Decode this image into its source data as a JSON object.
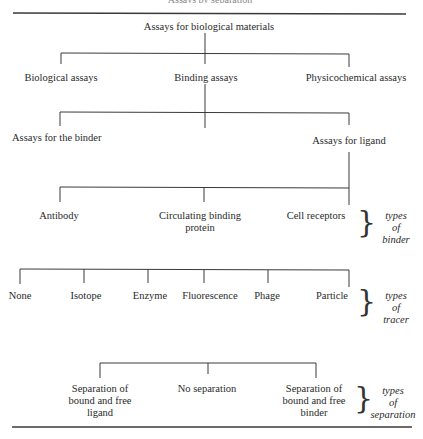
{
  "header": {
    "cut_caption": "Assays by separation"
  },
  "tree": {
    "root": "Assays for biological materials",
    "level1": [
      "Biological assays",
      "Binding assays",
      "Physicochemical assays"
    ],
    "level2": [
      "Assays for the binder",
      "Assays for ligand"
    ],
    "binders": [
      "Antibody",
      "Circulating binding",
      "protein",
      "Cell receptors"
    ],
    "tracers": [
      "None",
      "Isotope",
      "Enzyme",
      "Fluorescence",
      "Phage",
      "Particle"
    ],
    "separation": [
      [
        "Separation of",
        "bound and free",
        "ligand"
      ],
      [
        "No separation"
      ],
      [
        "Separation of",
        "bound and free",
        "binder"
      ]
    ]
  },
  "annotations": {
    "binder": [
      "types",
      "of",
      "binder"
    ],
    "tracer": [
      "types",
      "of",
      "tracer"
    ],
    "separation": [
      "types",
      "of",
      "separation"
    ],
    "brace_glyph": "}"
  },
  "colors": {
    "line": "#3a3a3a",
    "text": "#2a2a2a"
  }
}
